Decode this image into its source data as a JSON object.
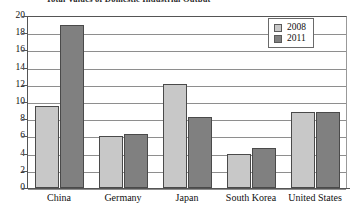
{
  "chart_data": {
    "type": "bar",
    "title": "Total Values of Domestic Industrial Output",
    "title_clipped": true,
    "xlabel": "",
    "ylabel": "",
    "categories": [
      "China",
      "Germany",
      "Japan",
      "South Korea",
      "United States"
    ],
    "series": [
      {
        "name": "2008",
        "color": "#c8c8c8",
        "values": [
          9.5,
          6.1,
          12.1,
          4.0,
          8.8
        ]
      },
      {
        "name": "2011",
        "color": "#808080",
        "values": [
          18.9,
          6.3,
          8.2,
          4.7,
          8.85
        ]
      }
    ],
    "ylim": [
      0,
      20
    ],
    "ytick_step": 2,
    "yticks": [
      20,
      18,
      16,
      14,
      12,
      10,
      8,
      6,
      4,
      2,
      0
    ],
    "grid": true,
    "grid_axis": "y",
    "legend_position": "top-right"
  }
}
